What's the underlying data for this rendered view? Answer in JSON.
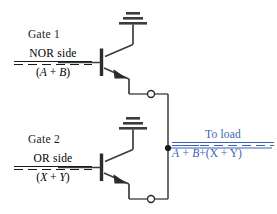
{
  "diagram": {
    "gates": [
      {
        "name": "gate-1",
        "title": "Gate 1",
        "side_label": "NOR side",
        "expression": {
          "open_paren": "(",
          "term_a": "A",
          "operator": "+",
          "term_b": "B",
          "close_paren": ")",
          "overbar": true,
          "overbar_style": "dashed",
          "plain": "(A + B)"
        },
        "device": "npn-transistor",
        "supply_symbol": "ground",
        "output_terminal": "open-circle"
      },
      {
        "name": "gate-2",
        "title": "Gate 2",
        "side_label": "OR side",
        "expression": {
          "open_paren": "(",
          "term_a": "X",
          "operator": "+",
          "term_b": "Y",
          "close_paren": ")",
          "overbar": true,
          "overbar_style": "dashed",
          "plain": "(X + Y)"
        },
        "device": "npn-transistor",
        "supply_symbol": "ground",
        "output_terminal": "open-circle"
      }
    ],
    "load": {
      "label": "To load",
      "color": "#3a63b8",
      "expression": {
        "barred_part": "A + B",
        "barred_part_overbar": true,
        "operator": "+",
        "tail": "(X + Y)",
        "plain": "A + B + (X + Y)"
      }
    },
    "nodes": {
      "junction_dot": "wired-or-junction",
      "bus": "vertical-output-bus"
    },
    "colors": {
      "wire": "#3c3c3c",
      "text": "#1a1a1a",
      "accent": "#3a63b8",
      "background": "#ffffff"
    }
  }
}
